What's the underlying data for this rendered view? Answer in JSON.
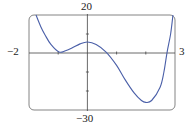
{
  "chart_data": {
    "type": "line",
    "title": "",
    "xlabel": "",
    "ylabel": "",
    "xlim": [
      -2,
      3
    ],
    "ylim": [
      -30,
      20
    ],
    "x_ticks": [
      -1,
      1,
      2
    ],
    "y_ticks": [
      10,
      -10,
      -20
    ],
    "grid": false,
    "legend": null,
    "tick_labels": {
      "x_min": "−2",
      "x_max": "3",
      "y_max": "20",
      "y_min": "−30"
    },
    "series": [
      {
        "name": "f(x)",
        "color": "#4a5fa8",
        "x": [
          -1.76,
          -1.6,
          -1.45,
          -1.25,
          -0.97,
          -0.75,
          -0.53,
          -0.25,
          0.0,
          0.3,
          0.64,
          1.0,
          1.29,
          1.6,
          1.85,
          2.0,
          2.2,
          2.49,
          2.62,
          2.73,
          2.85,
          2.93
        ],
        "y": [
          20,
          14,
          9.5,
          4.5,
          0.5,
          1.2,
          2.6,
          4.8,
          5.8,
          4.5,
          0.5,
          -6.5,
          -14,
          -21,
          -25,
          -26,
          -25,
          -18,
          -10,
          0.5,
          10,
          20
        ]
      }
    ]
  },
  "labels": {
    "x_min": "−2",
    "x_max": "3",
    "y_max": "20",
    "y_min": "−30"
  },
  "colors": {
    "curve": "#4a5fa8",
    "frame": "#555555",
    "axes": "#444444"
  }
}
